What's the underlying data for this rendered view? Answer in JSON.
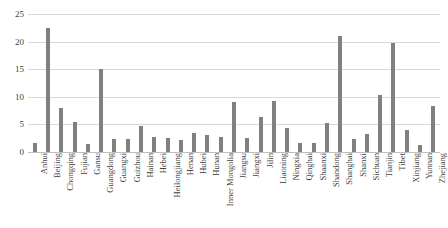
{
  "chart_data": {
    "type": "bar",
    "title": "",
    "subtitle": "",
    "xlabel": "",
    "ylabel": "",
    "ylim": [
      0,
      25
    ],
    "yticks": [
      0,
      5,
      10,
      15,
      20,
      25
    ],
    "ytick_labels": [
      "0",
      "5",
      "10",
      "15",
      "20",
      "25"
    ],
    "grid": true,
    "legend": false,
    "legend_position": "none",
    "bar_color": "#808080",
    "gridline_color": "#d9d9d9",
    "categories": [
      "Anhui",
      "Beijing",
      "Chongqing",
      "Fujian",
      "Gansu",
      "Guangdong",
      "Guangxi",
      "Guizhou",
      "Hainan",
      "Hebei",
      "Heilongjiang",
      "Henan",
      "Hubei",
      "Hunan",
      "Inner Mongolia",
      "Jiangsu",
      "Jiangxi",
      "Jilin",
      "Liaoning",
      "Ningxia",
      "Qinghai",
      "Shaanxi",
      "Shandong",
      "Shanghai",
      "Shanxi",
      "Sichuan",
      "Tianjin",
      "Tibet",
      "Xinjiang",
      "Yunnan",
      "Zhejiang"
    ],
    "values": [
      1.7,
      22.5,
      7.9,
      5.5,
      1.4,
      15.0,
      2.4,
      2.3,
      4.7,
      2.7,
      2.6,
      2.2,
      3.5,
      3.0,
      2.8,
      9.0,
      2.5,
      6.3,
      9.2,
      4.3,
      1.6,
      1.6,
      5.2,
      21.0,
      2.4,
      3.2,
      10.3,
      19.7,
      4.0,
      1.3,
      8.3
    ]
  }
}
